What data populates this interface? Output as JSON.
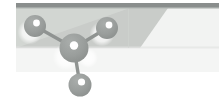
{
  "banner": {
    "kind": "molecule-header-banner",
    "width": 219,
    "height": 107,
    "page_background": "#ffffff",
    "alt_text": "Stylized molecule model banner",
    "bands": [
      {
        "name": "top-accent-bar",
        "color": "#8a8e8d",
        "x": 16,
        "y": 3,
        "width": 203,
        "height": 5
      },
      {
        "name": "upper-band",
        "color": "#c9ccc9",
        "x": 16,
        "y": 8,
        "width": 203,
        "height": 40
      },
      {
        "name": "lower-band",
        "color": "#f4f5f4",
        "x": 16,
        "y": 48,
        "width": 203,
        "height": 24
      }
    ],
    "wedge": {
      "name": "diagonal-light-wedge",
      "color": "#f2f3f2",
      "points": "168,8 219,8 219,48 140,48"
    },
    "highlight_sweep": {
      "name": "diagonal-highlight",
      "color": "#d8dbd8",
      "points": "16,8 130,8 16,48"
    }
  },
  "molecule": {
    "name": "molecule-model",
    "atom_fill": "#9a9e9c",
    "atom_fill_dark": "#8d918f",
    "atom_highlight": "#ffffff",
    "bond_color": "#8f9391",
    "glow_color": "#ffffff",
    "atoms": [
      {
        "id": "atom-center",
        "label": "center",
        "cx": 74,
        "cy": 48,
        "r": 14.5,
        "hl_dx": 0,
        "hl_dy": -2.5,
        "hl_r": 4.2
      },
      {
        "id": "atom-upper-left",
        "label": "upper-left",
        "cx": 35,
        "cy": 26,
        "r": 11.0,
        "hl_dx": 1.5,
        "hl_dy": -3.0,
        "hl_r": 3.4
      },
      {
        "id": "atom-upper-right",
        "label": "upper-right",
        "cx": 107,
        "cy": 28,
        "r": 11.0,
        "hl_dx": 2.0,
        "hl_dy": -3.0,
        "hl_r": 3.4
      },
      {
        "id": "atom-lower-center",
        "label": "lower-center",
        "cx": 80,
        "cy": 85,
        "r": 11.5,
        "hl_dx": 1.5,
        "hl_dy": -3.0,
        "hl_r": 3.6
      }
    ],
    "bonds": [
      {
        "id": "bond-center-upper-left",
        "from": "atom-center",
        "to": "atom-upper-left",
        "x1": 74,
        "y1": 48,
        "x2": 35,
        "y2": 26,
        "width": 3.4
      },
      {
        "id": "bond-center-upper-right",
        "from": "atom-center",
        "to": "atom-upper-right",
        "x1": 74,
        "y1": 48,
        "x2": 107,
        "y2": 28,
        "width": 3.4
      },
      {
        "id": "bond-center-lower-center",
        "from": "atom-center",
        "to": "atom-lower-center",
        "x1": 74,
        "y1": 48,
        "x2": 80,
        "y2": 85,
        "width": 3.4
      }
    ],
    "glows": [
      {
        "id": "glow-upper-left",
        "cx": 30,
        "cy": 32,
        "r": 12
      },
      {
        "id": "glow-upper-right",
        "cx": 102,
        "cy": 34,
        "r": 12
      },
      {
        "id": "glow-center",
        "cx": 66,
        "cy": 56,
        "r": 13
      }
    ]
  }
}
